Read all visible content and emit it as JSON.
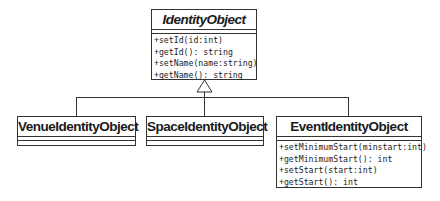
{
  "diagram": {
    "type": "UML class diagram",
    "parent": {
      "name": "IdentityObject",
      "abstract": true,
      "operations": [
        "+setId(id:int)",
        "+getId(): string",
        "+setName(name:string)",
        "+getName(): string"
      ]
    },
    "children": [
      {
        "name": "VenueIdentityObject",
        "operations": []
      },
      {
        "name": "SpaceIdentityObject",
        "operations": []
      },
      {
        "name": "EventIdentityObject",
        "operations": [
          "+setMinimumStart(minstart:int)",
          "+getMinimumStart(): int",
          "+setStart(start:int)",
          "+getStart(): int"
        ]
      }
    ],
    "relationship": "generalization (inheritance)",
    "colors": {
      "line": "#333333",
      "background": "#ffffff"
    }
  }
}
